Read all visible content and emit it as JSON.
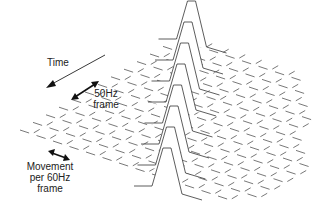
{
  "diagram": {
    "labels": {
      "time": "Time",
      "frame50_line1": "50Hz",
      "frame50_line2": "frame",
      "movement_line1": "Movement",
      "movement_line2": "per  60Hz",
      "movement_line3": "frame"
    },
    "peak_count": 8,
    "colors": {
      "line": "#333333",
      "grid": "#555555",
      "background": "#ffffff"
    }
  }
}
